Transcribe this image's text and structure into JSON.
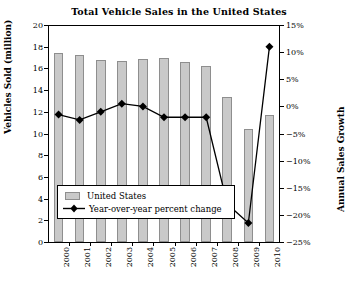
{
  "chart_data": {
    "type": "bar",
    "title": "Total Vehicle Sales in the United States",
    "xlabel": "",
    "ylabel": "Vehicles Sold (million)",
    "ylabel_right": "Annual Sales Growth",
    "categories": [
      "2000",
      "2001",
      "2002",
      "2003",
      "2004",
      "2005",
      "2006",
      "2007",
      "2008",
      "2009",
      "2010"
    ],
    "ylim": [
      0,
      20
    ],
    "ylim_right": [
      -25,
      15
    ],
    "ytick_step": 2,
    "ytick_step_right": 5,
    "yticks": [
      "0",
      "2",
      "4",
      "6",
      "8",
      "10",
      "12",
      "14",
      "16",
      "18",
      "20"
    ],
    "yticks_right": [
      "-25%",
      "-20%",
      "-15%",
      "-10%",
      "-5%",
      "0%",
      "5%",
      "10%",
      "15%"
    ],
    "grid": false,
    "legend_position": "lower-left-inside",
    "series": [
      {
        "name": "United States",
        "type": "bar",
        "axis": "left",
        "unit": "million vehicles",
        "color": "#c9c9c9",
        "edge_color": "#8e8e8e",
        "values": [
          17.4,
          17.2,
          16.8,
          16.7,
          16.9,
          17.0,
          16.6,
          16.2,
          13.4,
          10.4,
          11.7
        ]
      },
      {
        "name": "Year-over-year percent change",
        "type": "line",
        "axis": "right",
        "unit": "percent",
        "color": "#000000",
        "marker": "diamond",
        "values": [
          -1.5,
          -2.5,
          -1.0,
          0.5,
          0.0,
          -2.0,
          -2.0,
          -2.0,
          -18.0,
          -21.5,
          11.0
        ]
      }
    ]
  },
  "legend": {
    "items": [
      {
        "label": "United States",
        "marker": "bar-swatch"
      },
      {
        "label": "Year-over-year percent change",
        "marker": "diamond-line"
      }
    ]
  }
}
